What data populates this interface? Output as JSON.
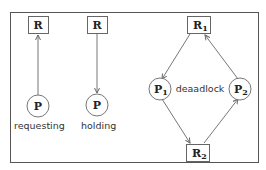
{
  "diagram": {
    "panels": [
      {
        "caption": "requesting",
        "resource": {
          "label": "R"
        },
        "process": {
          "label": "P"
        },
        "edge": "P -> R"
      },
      {
        "caption": "holding",
        "resource": {
          "label": "R"
        },
        "process": {
          "label": "P"
        },
        "edge": "R -> P"
      },
      {
        "caption": "deaadlock",
        "resources": [
          {
            "label": "R",
            "sub": "1"
          },
          {
            "label": "R",
            "sub": "2"
          }
        ],
        "processes": [
          {
            "label": "P",
            "sub": "1"
          },
          {
            "label": "P",
            "sub": "2"
          }
        ],
        "edges": [
          "R1 -> P1",
          "P1 -> R2",
          "R2 -> P2",
          "P2 -> R1"
        ]
      }
    ]
  }
}
